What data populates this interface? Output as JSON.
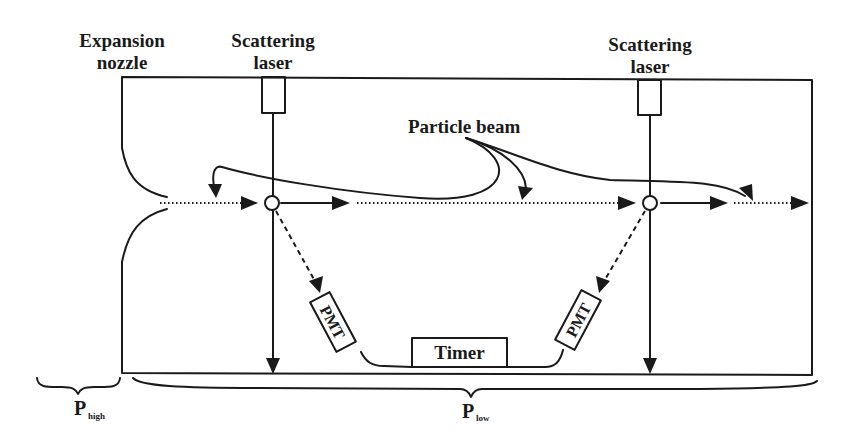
{
  "diagram": {
    "labels": {
      "expansion_nozzle_line1": "Expansion",
      "expansion_nozzle_line2": "nozzle",
      "laser_left_line1": "Scattering",
      "laser_left_line2": "laser",
      "laser_right_line1": "Scattering",
      "laser_right_line2": "laser",
      "particle_beam": "Particle beam",
      "pmt_left": "PMT",
      "pmt_right": "PMT",
      "timer": "Timer",
      "p_high_main": "P",
      "p_high_sub": "high",
      "p_low_main": "P",
      "p_low_sub": "low"
    },
    "components": [
      {
        "id": "expansion-nozzle",
        "label": "Expansion nozzle"
      },
      {
        "id": "scattering-laser-1",
        "label": "Scattering laser"
      },
      {
        "id": "scattering-laser-2",
        "label": "Scattering laser"
      },
      {
        "id": "pmt-1",
        "label": "PMT"
      },
      {
        "id": "pmt-2",
        "label": "PMT"
      },
      {
        "id": "timer",
        "label": "Timer"
      }
    ],
    "regions": [
      {
        "id": "high-pressure",
        "label": "P_high"
      },
      {
        "id": "low-pressure",
        "label": "P_low"
      }
    ],
    "colors": {
      "ink": "#1a1a1a",
      "background": "#ffffff"
    }
  }
}
